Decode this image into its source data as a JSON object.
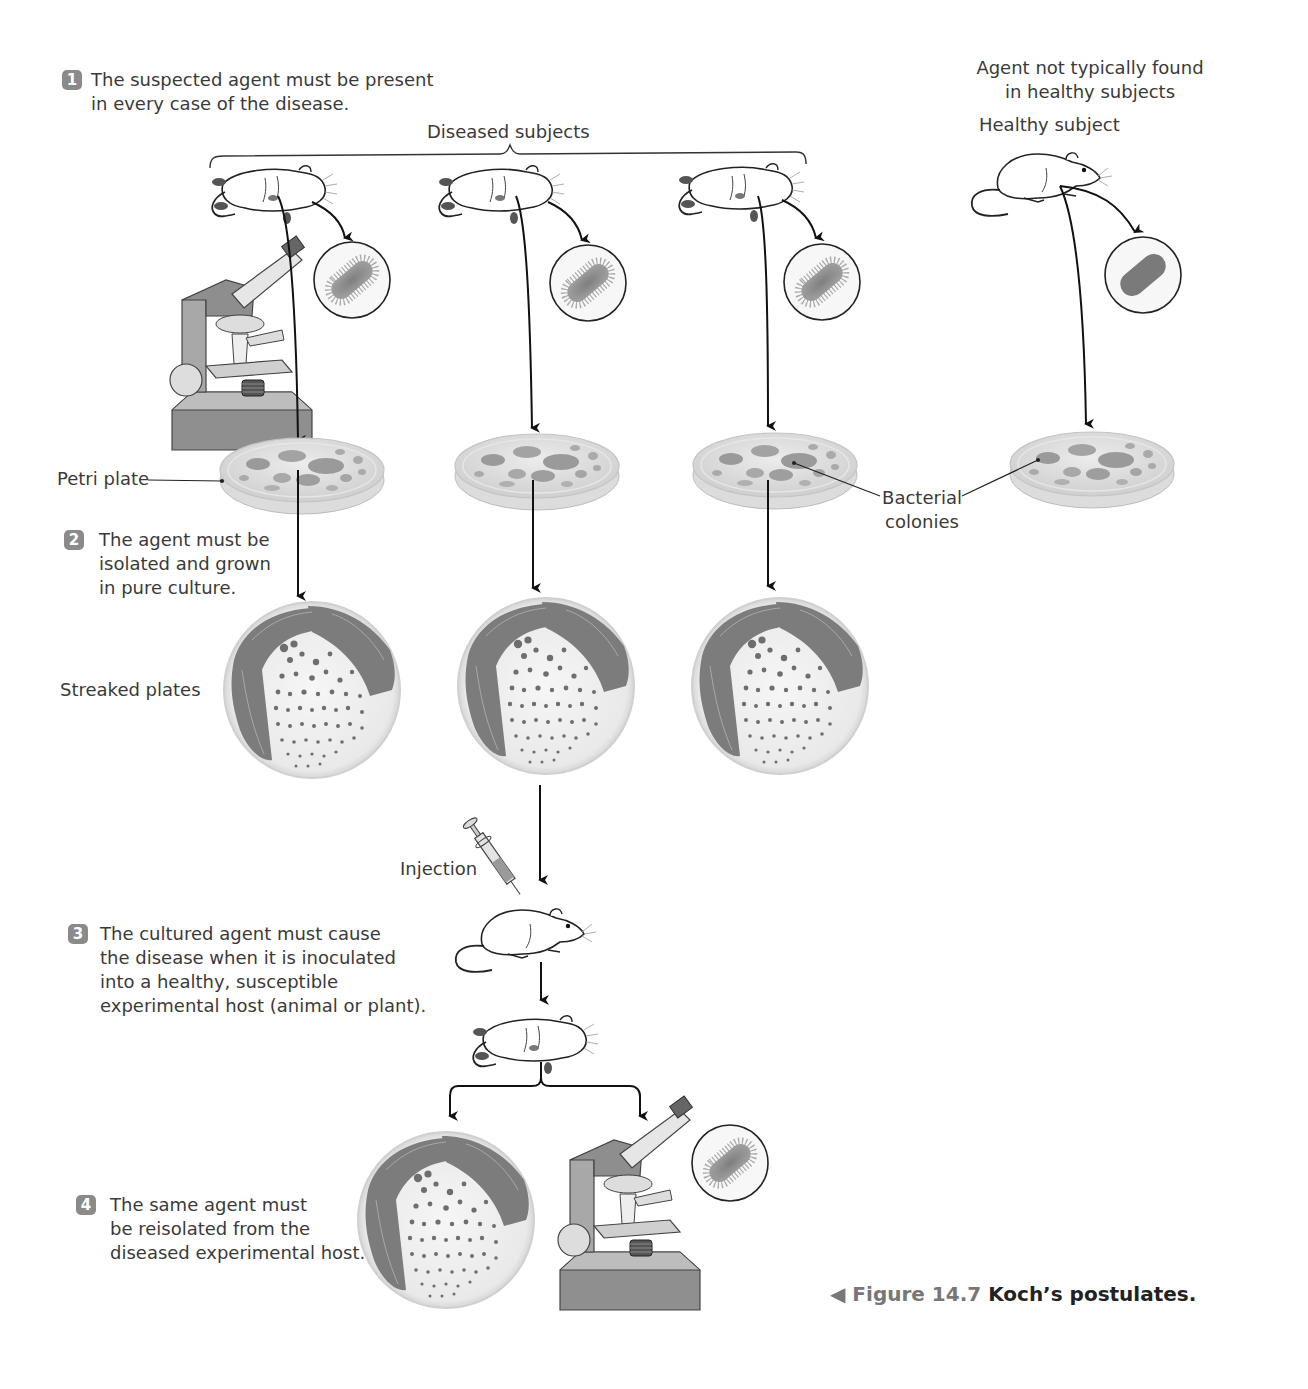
{
  "figure": {
    "number_label": "Figure 14.7",
    "title": "Koch’s postulates.",
    "pointer_icon": "left-triangle-icon"
  },
  "steps": [
    {
      "number": "1",
      "text": "The suspected agent must be present\nin every case of the disease."
    },
    {
      "number": "2",
      "text": "The agent must be\nisolated and grown\nin pure culture."
    },
    {
      "number": "3",
      "text": "The cultured agent must cause\nthe disease when it is inoculated\ninto a healthy, susceptible\nexperimental host (animal or plant)."
    },
    {
      "number": "4",
      "text": "The same agent must\nbe reisolated from the\ndiseased experimental host."
    }
  ],
  "labels": {
    "diseased_subjects": "Diseased subjects",
    "healthy_note_line1": "Agent not typically found",
    "healthy_note_line2": "in healthy subjects",
    "healthy_subject": "Healthy subject",
    "petri_plate": "Petri plate",
    "bacterial_colonies_line1": "Bacterial",
    "bacterial_colonies_line2": "colonies",
    "streaked_plates": "Streaked plates",
    "injection": "Injection"
  },
  "colors": {
    "badge": "#8a8a8a",
    "arrow": "#111111",
    "bacterium": "#8c8c8c",
    "streak": "#7a7a7a",
    "petri_agar": "#d9d9d9",
    "microscope": "#9a9a9a",
    "caption_number": "#777777",
    "caption_title": "#222222"
  }
}
